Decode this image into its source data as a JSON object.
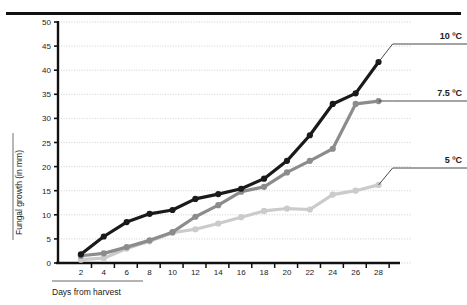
{
  "chart_data": {
    "type": "line",
    "title": "",
    "xlabel": "Days from harvest",
    "ylabel": "Fungal growth (in mm)",
    "x": [
      2,
      4,
      6,
      8,
      10,
      12,
      14,
      16,
      18,
      20,
      22,
      24,
      26,
      28
    ],
    "xlim": [
      0,
      29
    ],
    "ylim": [
      0,
      50
    ],
    "xticks": [
      2,
      4,
      6,
      8,
      10,
      12,
      14,
      16,
      18,
      20,
      22,
      24,
      26,
      28
    ],
    "yticks": [
      0,
      5,
      10,
      15,
      20,
      25,
      30,
      35,
      40,
      45,
      50
    ],
    "grid": "horizontal-dotted",
    "legend_position": "right-inline-labels",
    "series": [
      {
        "name": "10 ºC",
        "color": "#1a1a1a",
        "marker": "circle",
        "values": [
          1.8,
          5.5,
          8.5,
          10.2,
          11.0,
          13.3,
          14.3,
          15.4,
          17.5,
          21.2,
          26.5,
          33.0,
          35.2,
          41.7
        ]
      },
      {
        "name": "7.5 ºC",
        "color": "#8c8c8c",
        "marker": "circle",
        "values": [
          1.5,
          2.0,
          3.3,
          4.7,
          6.4,
          9.6,
          12.0,
          14.8,
          15.8,
          18.8,
          21.2,
          23.7,
          33.0,
          33.6
        ]
      },
      {
        "name": "5 ºC",
        "color": "#cbcbcb",
        "marker": "circle",
        "values": [
          0.7,
          1.0,
          3.0,
          4.5,
          6.3,
          7.0,
          8.2,
          9.5,
          10.8,
          11.3,
          11.1,
          14.2,
          15.0,
          16.2
        ]
      }
    ]
  },
  "axes": {
    "y_tick_labels": [
      "0",
      "5",
      "10",
      "15",
      "20",
      "25",
      "30",
      "35",
      "40",
      "45",
      "50"
    ],
    "x_tick_labels": [
      "2",
      "4",
      "6",
      "8",
      "10",
      "12",
      "14",
      "16",
      "18",
      "20",
      "22",
      "24",
      "26",
      "28"
    ],
    "y_axis_title": "Fungal growth (in mm)",
    "x_axis_title": "Days from harvest"
  },
  "annotations": {
    "label_10c": "10 ºC",
    "label_75c": "7.5 ºC",
    "label_5c": "5 ºC"
  },
  "colors": {
    "series_10c": "#1a1a1a",
    "series_75c": "#8c8c8c",
    "series_5c": "#cbcbcb",
    "axis": "#111111",
    "grid": "#b9b9c9",
    "background": "#ffffff"
  }
}
